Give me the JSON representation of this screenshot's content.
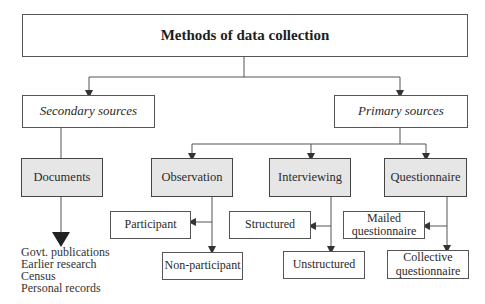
{
  "diagram": {
    "title": "Methods of data collection",
    "secondary": {
      "label": "Secondary sources",
      "child": "Documents",
      "examples": [
        "Govt. publications",
        "Earlier research",
        "Census",
        "Personal records"
      ]
    },
    "primary": {
      "label": "Primary sources",
      "methods": [
        {
          "label": "Observation",
          "sub": [
            "Participant",
            "Non-participant"
          ]
        },
        {
          "label": "Interviewing",
          "sub": [
            "Structured",
            "Unstructured"
          ]
        },
        {
          "label": "Questionnaire",
          "sub": [
            "Mailed questionnaire",
            "Collective questionnaire"
          ]
        }
      ]
    },
    "colors": {
      "box_fill_gray": "#e6e6e6",
      "line": "#444444"
    }
  }
}
